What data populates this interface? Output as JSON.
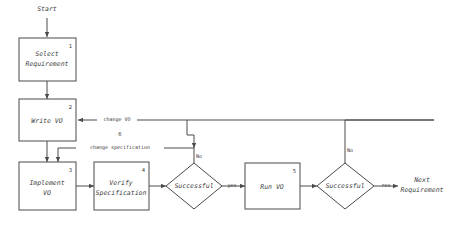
{
  "diagram": {
    "stroke_color": "#4a4a4a",
    "text_color": "#3a3a3a",
    "background": "#ffffff",
    "terminals": {
      "start": "Start",
      "end_line1": "Next",
      "end_line2": "Requirement"
    },
    "nodes": [
      {
        "id": "n1",
        "number": "1",
        "line1": "Select",
        "line2": "Requirement",
        "shape": "box"
      },
      {
        "id": "n2",
        "number": "2",
        "line1": "Write VO",
        "line2": "",
        "shape": "box"
      },
      {
        "id": "n3",
        "number": "3",
        "line1": "Implement",
        "line2": "VO",
        "shape": "box"
      },
      {
        "id": "n4",
        "number": "4",
        "line1": "Verify",
        "line2": "Specification",
        "shape": "box"
      },
      {
        "id": "n5",
        "number": "5",
        "line1": "Run VO",
        "line2": "",
        "shape": "box"
      },
      {
        "id": "d1",
        "number": "",
        "line1": "Successful",
        "line2": "",
        "shape": "diamond"
      },
      {
        "id": "d2",
        "number": "",
        "line1": "Successful",
        "line2": "",
        "shape": "diamond"
      }
    ],
    "edge_labels": {
      "change_vo": "change VO",
      "change_specification": "change specification",
      "step_six": "6",
      "no_first": "No",
      "no_second": "No",
      "yes_first": "yes",
      "yes_second": "res"
    }
  }
}
